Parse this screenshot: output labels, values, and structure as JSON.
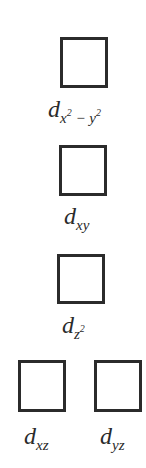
{
  "diagram": {
    "title": "",
    "orbitals": [
      {
        "id": "dx2-y2",
        "main": "d",
        "sub1": "x",
        "sup1": "2",
        "mid": " − ",
        "sub2": "y",
        "sup2": "2"
      },
      {
        "id": "dxy",
        "main": "d",
        "sub": "xy"
      },
      {
        "id": "dz2",
        "main": "d",
        "sub": "z",
        "sup": "2"
      },
      {
        "id": "dxz",
        "main": "d",
        "sub": "xz"
      },
      {
        "id": "dyz",
        "main": "d",
        "sub": "yz"
      }
    ],
    "colors": {
      "box_border": "#2b2b2b",
      "text": "#2a2a2a",
      "background": "#ffffff"
    }
  }
}
